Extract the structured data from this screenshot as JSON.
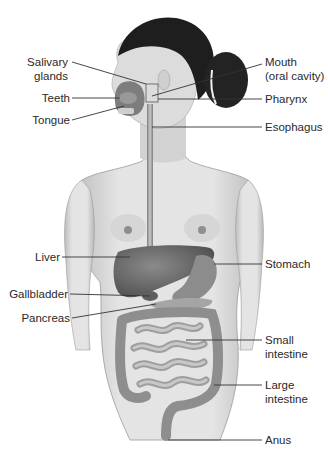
{
  "diagram": {
    "style": "grayscale anatomical illustration",
    "labels_left": [
      {
        "id": "salivary",
        "text_line1": "Salivary",
        "text_line2": "glands"
      },
      {
        "id": "teeth",
        "text": "Teeth"
      },
      {
        "id": "tongue",
        "text": "Tongue"
      },
      {
        "id": "liver",
        "text": "Liver"
      },
      {
        "id": "gallbladder",
        "text": "Gallbladder"
      },
      {
        "id": "pancreas",
        "text": "Pancreas"
      }
    ],
    "labels_right": [
      {
        "id": "mouth",
        "text_line1": "Mouth",
        "text_line2": "(oral cavity)"
      },
      {
        "id": "pharynx",
        "text": "Pharynx"
      },
      {
        "id": "esophagus",
        "text": "Esophagus"
      },
      {
        "id": "stomach",
        "text": "Stomach"
      },
      {
        "id": "small-intestine",
        "text_line1": "Small",
        "text_line2": "intestine"
      },
      {
        "id": "large-intestine",
        "text_line1": "Large",
        "text_line2": "intestine"
      },
      {
        "id": "anus",
        "text": "Anus"
      }
    ],
    "colors": {
      "background": "#ffffff",
      "label_text": "#2a2a2a",
      "leader_line": "#333333",
      "hair": "#1e1e1e",
      "skin": "#d9d9d9",
      "organ": "#6e6e6e"
    }
  }
}
